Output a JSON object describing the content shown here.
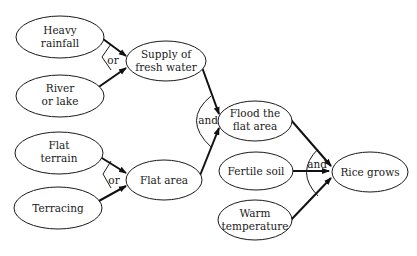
{
  "diagram": {
    "type": "cause-effect flow diagram",
    "nodes": [
      {
        "id": "heavy_rainfall",
        "lines": [
          "Heavy",
          "rainfall"
        ]
      },
      {
        "id": "river_lake",
        "lines": [
          "River",
          "or lake"
        ]
      },
      {
        "id": "supply_water",
        "lines": [
          "Supply of",
          "fresh water"
        ]
      },
      {
        "id": "flat_terrain",
        "lines": [
          "Flat",
          "terrain"
        ]
      },
      {
        "id": "terracing",
        "lines": [
          "Terracing"
        ]
      },
      {
        "id": "flat_area",
        "lines": [
          "Flat area"
        ]
      },
      {
        "id": "flood_area",
        "lines": [
          "Flood the",
          "flat area"
        ]
      },
      {
        "id": "fertile_soil",
        "lines": [
          "Fertile soil"
        ]
      },
      {
        "id": "warm_temp",
        "lines": [
          "Warm",
          "temperature"
        ]
      },
      {
        "id": "rice_grows",
        "lines": [
          "Rice grows"
        ]
      }
    ],
    "gates": [
      {
        "id": "gate1",
        "label": "or",
        "inputs": [
          "heavy_rainfall",
          "river_lake"
        ],
        "output": "supply_water"
      },
      {
        "id": "gate2",
        "label": "or",
        "inputs": [
          "flat_terrain",
          "terracing"
        ],
        "output": "flat_area"
      },
      {
        "id": "gate3",
        "label": "and",
        "inputs": [
          "supply_water",
          "flat_area"
        ],
        "output": "flood_area"
      },
      {
        "id": "gate4",
        "label": "and",
        "inputs": [
          "flood_area",
          "fertile_soil",
          "warm_temp"
        ],
        "output": "rice_grows"
      }
    ],
    "edges": [
      {
        "from": "heavy_rainfall",
        "to": "supply_water"
      },
      {
        "from": "river_lake",
        "to": "supply_water"
      },
      {
        "from": "flat_terrain",
        "to": "flat_area"
      },
      {
        "from": "terracing",
        "to": "flat_area"
      },
      {
        "from": "supply_water",
        "to": "flood_area"
      },
      {
        "from": "flat_area",
        "to": "flood_area"
      },
      {
        "from": "flood_area",
        "to": "rice_grows"
      },
      {
        "from": "fertile_soil",
        "to": "rice_grows"
      },
      {
        "from": "warm_temp",
        "to": "rice_grows"
      }
    ]
  }
}
